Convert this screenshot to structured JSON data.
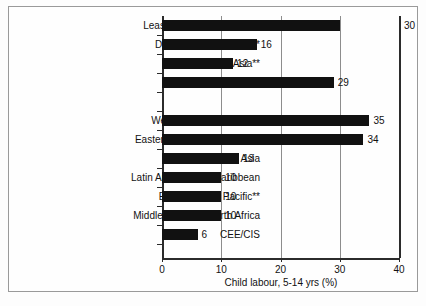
{
  "chart_data": {
    "type": "bar",
    "orientation": "horizontal",
    "title": "",
    "xlabel": "Child labour, 5-14 yrs (%)",
    "ylabel": "",
    "xlim": [
      0,
      40
    ],
    "xticks": [
      0,
      10,
      20,
      30,
      40
    ],
    "xtick_labels": [
      "0",
      "10",
      "20",
      "30",
      "40"
    ],
    "grid": "vertical",
    "legend": "none",
    "categories": [
      "Least developed countries",
      "Developing countries***",
      "Asia**",
      "Africa*",
      "",
      "West and Central Africa*",
      "Eastern and Southern Africa",
      "South Asia",
      "Latin America and Caribbean",
      "East Asia and Pacific**",
      "Middle East and North Africa",
      "CEE/CIS"
    ],
    "values": [
      30,
      16,
      12,
      29,
      null,
      35,
      34,
      13,
      10,
      10,
      10,
      6
    ],
    "value_labels": [
      "30",
      "16",
      "12",
      "29",
      "",
      "35",
      "34",
      "13",
      "10",
      "10",
      "10",
      "6"
    ],
    "bar_color": "#111111"
  },
  "axis": {
    "x_title": "Child labour, 5-14 yrs (%)",
    "ticks": [
      {
        "label": "0",
        "value": 0
      },
      {
        "label": "10",
        "value": 10
      },
      {
        "label": "20",
        "value": 20
      },
      {
        "label": "30",
        "value": 30
      },
      {
        "label": "40",
        "value": 40
      }
    ]
  },
  "rows": [
    {
      "label": "Least developed countries",
      "value": 30,
      "value_label": "30",
      "label_outside_plot": true
    },
    {
      "label": "Developing countries***",
      "value": 16,
      "value_label": "16",
      "label_outside_plot": false
    },
    {
      "label": "Asia**",
      "value": 12,
      "value_label": "12",
      "label_outside_plot": false
    },
    {
      "label": "Africa*",
      "value": 29,
      "value_label": "29",
      "label_outside_plot": false
    },
    {
      "label": "",
      "value": null,
      "value_label": "",
      "label_outside_plot": false
    },
    {
      "label": "West and Central Africa*",
      "value": 35,
      "value_label": "35",
      "label_outside_plot": false
    },
    {
      "label": "Eastern and Southern Africa",
      "value": 34,
      "value_label": "34",
      "label_outside_plot": false
    },
    {
      "label": "South Asia",
      "value": 13,
      "value_label": "13",
      "label_outside_plot": false
    },
    {
      "label": "Latin America and Caribbean",
      "value": 10,
      "value_label": "10",
      "label_outside_plot": false
    },
    {
      "label": "East Asia and Pacific**",
      "value": 10,
      "value_label": "10",
      "label_outside_plot": false
    },
    {
      "label": "Middle East and North Africa",
      "value": 10,
      "value_label": "10",
      "label_outside_plot": false
    },
    {
      "label": "CEE/CIS",
      "value": 6,
      "value_label": "6",
      "label_outside_plot": false
    }
  ],
  "colors": {
    "bar": "#111111",
    "axis": "#2b2b2b",
    "gridline": "#8d8d8d",
    "frame": "#9a9a9a",
    "background": "#fefefe",
    "text": "#111111"
  }
}
